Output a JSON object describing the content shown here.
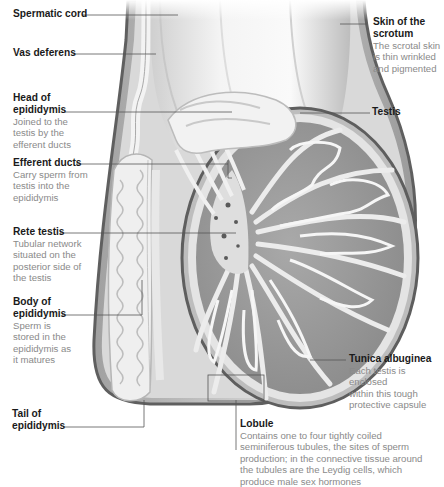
{
  "diagram": {
    "type": "anatomical-cross-section",
    "colors": {
      "background": "#ffffff",
      "title_text": "#1a1a1a",
      "description_text": "#8a8a8a",
      "leader_line": "#555555",
      "tissue_dark": "#7a7a7a",
      "tissue_mid": "#9e9e9e",
      "tissue_light": "#e6e6e6",
      "scrotal_wall": "#6e6e6e"
    }
  },
  "labels": {
    "spermatic_cord": {
      "title": "Spermatic cord",
      "description": ""
    },
    "vas_deferens": {
      "title": "Vas deferens",
      "description": ""
    },
    "head_of_epididymis": {
      "title": "Head of\nepididymis",
      "description": "Joined to the\ntestis by the\nefferent ducts"
    },
    "efferent_ducts": {
      "title": "Efferent ducts",
      "description": "Carry sperm from\ntestis into the\nepididymis"
    },
    "rete_testis": {
      "title": "Rete testis",
      "description": "Tubular network\nsituated on the\nposterior side of\nthe testis"
    },
    "body_of_epididymis": {
      "title": "Body of\nepididymis",
      "description": "Sperm is\nstored in the\nepididymis as\nit matures"
    },
    "tail_of_epididymis": {
      "title": "Tail of\nepididymis",
      "description": ""
    },
    "skin_of_scrotum": {
      "title": "Skin of the\nscrotum",
      "description": "The scrotal skin\nis thin wrinkled\nand pigmented"
    },
    "testis": {
      "title": "Testis",
      "description": ""
    },
    "tunica_albuginea": {
      "title": "Tunica albuginea",
      "description": "Each testis is enclosed\nwithin this tough\nprotective capsule"
    },
    "lobule": {
      "title": "Lobule",
      "description": "Contains one to four tightly coiled\nseminiferous tubules, the sites of sperm\nproduction; in the connective tissue around\nthe tubules are the Leydig cells, which\nproduce male sex hormones"
    }
  }
}
